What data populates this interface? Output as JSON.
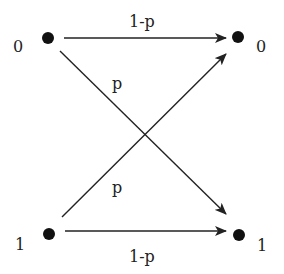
{
  "diagram": {
    "inputs": [
      {
        "label": "0"
      },
      {
        "label": "1"
      }
    ],
    "outputs": [
      {
        "label": "0"
      },
      {
        "label": "1"
      }
    ],
    "edges": [
      {
        "from": "0",
        "to": "0",
        "label": "1-p"
      },
      {
        "from": "0",
        "to": "1",
        "label": "p"
      },
      {
        "from": "1",
        "to": "0",
        "label": "p"
      },
      {
        "from": "1",
        "to": "1",
        "label": "1-p"
      }
    ],
    "colors": {
      "line": "#222222",
      "node": "#111111",
      "background": "#ffffff"
    }
  }
}
